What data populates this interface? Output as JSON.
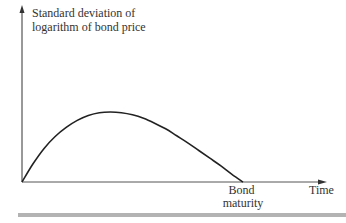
{
  "chart_data": {
    "type": "line",
    "title": "",
    "ylabel_lines": [
      "Standard deviation of",
      "logarithm of bond price"
    ],
    "xlabel": "Time",
    "xtick_label_lines": [
      "Bond",
      "maturity"
    ],
    "grid": false,
    "legend": "none",
    "xlim": [
      0,
      1
    ],
    "ylim": [
      0,
      1
    ],
    "series": [
      {
        "name": "Standard deviation of logarithm of bond price",
        "x": [
          0,
          0.05,
          0.1,
          0.15,
          0.2,
          0.25,
          0.3,
          0.35,
          0.4,
          0.45,
          0.5,
          0.55,
          0.6,
          0.65,
          0.7,
          0.75,
          0.8,
          0.85,
          0.9,
          0.95,
          1.0
        ],
        "y": [
          0,
          0.26,
          0.48,
          0.65,
          0.78,
          0.88,
          0.95,
          0.99,
          1.0,
          0.99,
          0.96,
          0.91,
          0.84,
          0.76,
          0.66,
          0.56,
          0.45,
          0.34,
          0.23,
          0.11,
          0
        ]
      }
    ],
    "annotations": [
      {
        "text": "Bond maturity",
        "x": 1.0
      }
    ]
  },
  "colors": {
    "axis": "#333333",
    "curve": "#222222",
    "bottom_rule": "#b3b3b3"
  }
}
